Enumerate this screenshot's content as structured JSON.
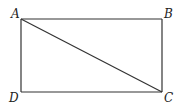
{
  "diagram": {
    "type": "rectangle-with-diagonal",
    "stroke_color": "#333333",
    "label_color": "#222222",
    "points": {
      "A": {
        "label": "A",
        "x": 21,
        "y": 19
      },
      "B": {
        "label": "B",
        "x": 162,
        "y": 19
      },
      "C": {
        "label": "C",
        "x": 162,
        "y": 92
      },
      "D": {
        "label": "D",
        "x": 21,
        "y": 92
      }
    },
    "segments": [
      {
        "from": "A",
        "to": "B"
      },
      {
        "from": "B",
        "to": "C"
      },
      {
        "from": "C",
        "to": "D"
      },
      {
        "from": "D",
        "to": "A"
      },
      {
        "from": "A",
        "to": "C"
      }
    ]
  }
}
